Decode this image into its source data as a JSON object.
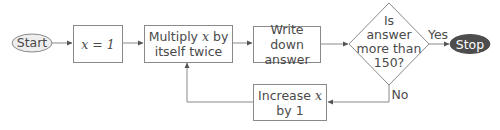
{
  "diagram": {
    "type": "flowchart",
    "nodes": {
      "start": {
        "label": "Start",
        "shape": "ellipse",
        "fill": "#eeeeee"
      },
      "set_x": {
        "label": "x = 1",
        "shape": "rectangle"
      },
      "multiply": {
        "label_line1_pre": "Multiply ",
        "label_line1_var": "x",
        "label_line1_post": " by",
        "label_line2": "itself twice",
        "shape": "rectangle"
      },
      "write": {
        "label_line1": "Write down",
        "label_line2": "answer",
        "shape": "rectangle"
      },
      "decision": {
        "label_line1": "Is",
        "label_line2": "answer",
        "label_line3": "more than",
        "label_line4": "150?",
        "shape": "diamond"
      },
      "stop": {
        "label": "Stop",
        "shape": "ellipse",
        "fill": "#4d4d4d",
        "text_color": "#ffffff"
      },
      "increase": {
        "label_line1_pre": "Increase ",
        "label_line1_var": "x",
        "label_line2": "by 1",
        "shape": "rectangle"
      }
    },
    "edges": [
      {
        "from": "start",
        "to": "set_x",
        "label": ""
      },
      {
        "from": "set_x",
        "to": "multiply",
        "label": ""
      },
      {
        "from": "multiply",
        "to": "write",
        "label": ""
      },
      {
        "from": "write",
        "to": "decision",
        "label": ""
      },
      {
        "from": "decision",
        "to": "stop",
        "label": "Yes"
      },
      {
        "from": "decision",
        "to": "increase",
        "label": "No"
      },
      {
        "from": "increase",
        "to": "multiply",
        "label": ""
      }
    ],
    "edge_labels": {
      "yes": "Yes",
      "no": "No"
    },
    "colors": {
      "line": "#8a8a8a",
      "text": "#4a4a4a",
      "start_fill": "#eeeeee",
      "stop_fill": "#4d4d4d"
    }
  }
}
